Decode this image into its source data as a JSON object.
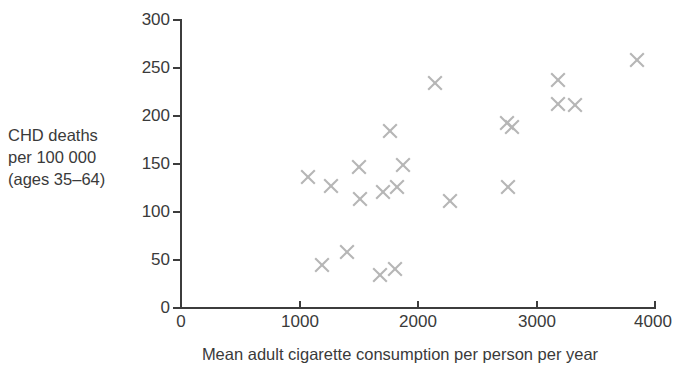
{
  "chart_data": {
    "type": "scatter",
    "title": "",
    "xlabel": "Mean adult cigarette consumption per person per year",
    "ylabel": "CHD deaths per 100 000 (ages 35–64)",
    "ylabel_lines": [
      "CHD deaths",
      "per 100 000",
      "(ages 35–64)"
    ],
    "xlim": [
      0,
      4000
    ],
    "ylim": [
      0,
      300
    ],
    "xticks": [
      0,
      1000,
      2000,
      3000,
      4000
    ],
    "yticks": [
      0,
      50,
      100,
      150,
      200,
      250,
      300
    ],
    "xtick_labels": [
      "0",
      "1000",
      "2000",
      "3000",
      "4000"
    ],
    "ytick_labels": [
      "0",
      "50",
      "100",
      "150",
      "200",
      "250",
      "300"
    ],
    "grid": false,
    "legend": false,
    "marker": "x",
    "marker_color": "#b6b6b6",
    "axis_color": "#3c3c3c",
    "text_color": "#3a3a3a",
    "points": [
      {
        "x": 1070,
        "y": 137
      },
      {
        "x": 1190,
        "y": 45
      },
      {
        "x": 1265,
        "y": 127
      },
      {
        "x": 1400,
        "y": 58
      },
      {
        "x": 1500,
        "y": 147
      },
      {
        "x": 1510,
        "y": 114
      },
      {
        "x": 1680,
        "y": 34
      },
      {
        "x": 1705,
        "y": 121
      },
      {
        "x": 1765,
        "y": 184
      },
      {
        "x": 1805,
        "y": 41
      },
      {
        "x": 1825,
        "y": 126
      },
      {
        "x": 1875,
        "y": 149
      },
      {
        "x": 2145,
        "y": 234
      },
      {
        "x": 2270,
        "y": 112
      },
      {
        "x": 2750,
        "y": 193
      },
      {
        "x": 2760,
        "y": 126
      },
      {
        "x": 2795,
        "y": 189
      },
      {
        "x": 3180,
        "y": 238
      },
      {
        "x": 3180,
        "y": 213
      },
      {
        "x": 3325,
        "y": 212
      },
      {
        "x": 3850,
        "y": 258
      }
    ]
  }
}
